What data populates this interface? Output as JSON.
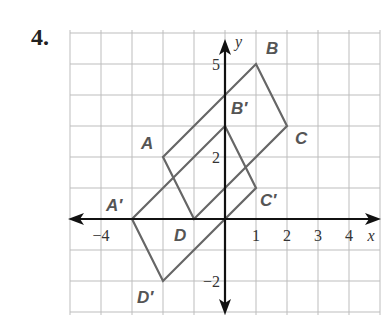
{
  "problem_number": "4.",
  "graph": {
    "x_range": [
      -5,
      5
    ],
    "y_range": [
      -3,
      6
    ],
    "x_axis_label": "x",
    "y_axis_label": "y",
    "x_tick_labels": [
      {
        "value": -4,
        "text": "−4"
      },
      {
        "value": 1,
        "text": "1"
      },
      {
        "value": 2,
        "text": "2"
      },
      {
        "value": 3,
        "text": "3"
      },
      {
        "value": 4,
        "text": "4"
      }
    ],
    "y_tick_labels": [
      {
        "value": 5,
        "text": "5"
      },
      {
        "value": 2,
        "text": "2"
      },
      {
        "value": -2,
        "text": "−2"
      }
    ],
    "colors": {
      "grid": "#bdbdbd",
      "axes": "#111111",
      "shape": "#666666",
      "label": "#555555"
    },
    "original_figure": {
      "name": "ABCD",
      "vertices": [
        {
          "label": "A",
          "x": -2,
          "y": 2
        },
        {
          "label": "B",
          "x": 1,
          "y": 5
        },
        {
          "label": "C",
          "x": 2,
          "y": 3
        },
        {
          "label": "D",
          "x": -1,
          "y": 0
        }
      ]
    },
    "image_figure": {
      "name": "A'B'C'D'",
      "vertices": [
        {
          "label": "A′",
          "x": -3,
          "y": 0
        },
        {
          "label": "B′",
          "x": 0,
          "y": 3
        },
        {
          "label": "C′",
          "x": 1,
          "y": 1
        },
        {
          "label": "D′",
          "x": -2,
          "y": -2
        }
      ]
    }
  }
}
